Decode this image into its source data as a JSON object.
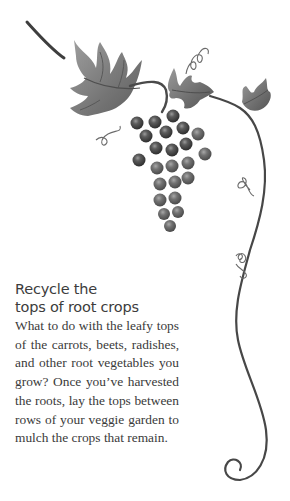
{
  "illustration": {
    "subject": "grape-vine",
    "description": "Watercolor grape vine with leaves, a bunch of grapes, curling tendrils and a long spiraling vine stem",
    "grape_count": 24,
    "colors": {
      "leaf": "#7d7d7d",
      "leaf_dark": "#555555",
      "grape": "#5a5a5a",
      "grape_dark": "#333333",
      "stem": "#4a4a4a",
      "tendril": "#6a6a6a"
    }
  },
  "article": {
    "heading_line1": "Recycle the",
    "heading_line2": "tops of root crops",
    "body": "What to do with the leafy tops of the carrots, beets, radishes, and other root vegetables you grow? Once you’ve harvested the roots, lay the tops between rows of your veggie garden to mulch the crops that remain."
  }
}
